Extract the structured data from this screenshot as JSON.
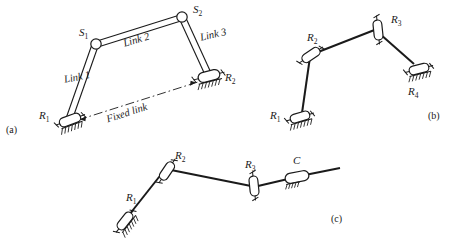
{
  "figure": {
    "ink_color": "#1a1a1a",
    "background": "#ffffff"
  },
  "panels": [
    {
      "id": "a",
      "caption": "(a)",
      "description": "RSSR spatial four-bar linkage",
      "joints": [
        {
          "name": "R1",
          "label": "R",
          "sub": "1",
          "type": "revolute-grounded"
        },
        {
          "name": "S1",
          "label": "S",
          "sub": "1",
          "type": "spherical"
        },
        {
          "name": "S2",
          "label": "S",
          "sub": "2",
          "type": "spherical"
        },
        {
          "name": "R2",
          "label": "R",
          "sub": "2",
          "type": "revolute-grounded"
        }
      ],
      "links": [
        {
          "name": "link-1",
          "label": "Link 1"
        },
        {
          "name": "link-2",
          "label": "Link 2"
        },
        {
          "name": "link-3",
          "label": "Link 3"
        },
        {
          "name": "fixed-link",
          "label": "Fixed link"
        }
      ]
    },
    {
      "id": "b",
      "caption": "(b)",
      "description": "RRRR four-bar linkage",
      "joints": [
        {
          "name": "R1",
          "label": "R",
          "sub": "1",
          "type": "revolute-grounded"
        },
        {
          "name": "R2",
          "label": "R",
          "sub": "2",
          "type": "revolute"
        },
        {
          "name": "R3",
          "label": "R",
          "sub": "3",
          "type": "revolute"
        },
        {
          "name": "R4",
          "label": "R",
          "sub": "4",
          "type": "revolute-grounded"
        }
      ]
    },
    {
      "id": "c",
      "caption": "(c)",
      "description": "RRRC chain ending in a cylindrical joint",
      "joints": [
        {
          "name": "R1",
          "label": "R",
          "sub": "1",
          "type": "revolute-grounded"
        },
        {
          "name": "R2",
          "label": "R",
          "sub": "2",
          "type": "revolute"
        },
        {
          "name": "R3",
          "label": "R",
          "sub": "3",
          "type": "revolute"
        },
        {
          "name": "C",
          "label": "C",
          "sub": "",
          "type": "cylindrical"
        }
      ]
    }
  ]
}
